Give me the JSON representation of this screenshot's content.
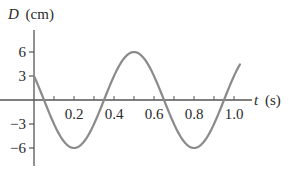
{
  "chart_data": {
    "type": "line",
    "title": "",
    "xlabel": "t (s)",
    "ylabel": "D (cm)",
    "xlabel_var": "t",
    "xlabel_unit": "(s)",
    "ylabel_var": "D",
    "ylabel_unit": "(cm)",
    "x_ticks": [
      "0.2",
      "0.4",
      "0.6",
      "0.8",
      "1.0"
    ],
    "y_ticks": [
      "6",
      "3",
      "−3",
      "−6"
    ],
    "xlim": [
      0,
      1.05
    ],
    "ylim": [
      -6,
      6
    ],
    "grid": false,
    "legend": null,
    "series": [
      {
        "name": "D(t)",
        "color": "#8a8a8a",
        "x": [
          0.0,
          0.05,
          0.1,
          0.15,
          0.2,
          0.25,
          0.3,
          0.35,
          0.4,
          0.45,
          0.5,
          0.55,
          0.6,
          0.65,
          0.7,
          0.75,
          0.8,
          0.85,
          0.9,
          0.95,
          1.0,
          1.03
        ],
        "values": [
          3.0,
          0.0,
          -3.0,
          -5.2,
          -6.0,
          -5.2,
          -3.0,
          0.0,
          3.0,
          5.2,
          6.0,
          5.2,
          3.0,
          0.0,
          -3.0,
          -5.2,
          -6.0,
          -5.2,
          -3.0,
          0.0,
          3.0,
          4.6
        ]
      }
    ],
    "amplitude_cm": 6,
    "period_s": 0.6
  }
}
